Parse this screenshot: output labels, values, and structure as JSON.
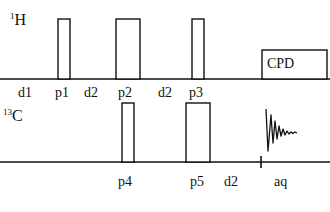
{
  "diagram": {
    "type": "nmr-pulse-sequence",
    "colors": {
      "line": "#111111",
      "background": "#ffffff"
    },
    "channels": [
      {
        "id": "H",
        "mass": "1",
        "nucleus": "H",
        "baseline_y": 79,
        "label_pos": {
          "x": 10,
          "y": 8
        },
        "elements": [
          {
            "kind": "pulse",
            "name": "p1",
            "x1": 58,
            "x2": 70,
            "top": 19
          },
          {
            "kind": "pulse",
            "name": "p2",
            "x1": 116,
            "x2": 140,
            "top": 19
          },
          {
            "kind": "pulse",
            "name": "p3",
            "x1": 192,
            "x2": 204,
            "top": 19
          },
          {
            "kind": "decoupling",
            "name": "CPD",
            "x1": 262,
            "x2": 327,
            "top": 50
          }
        ],
        "timing_labels": [
          {
            "text": "d1",
            "x": 18
          },
          {
            "text": "p1",
            "x": 55
          },
          {
            "text": "d2",
            "x": 84
          },
          {
            "text": "p2",
            "x": 118
          },
          {
            "text": "d2",
            "x": 158
          },
          {
            "text": "p3",
            "x": 189
          }
        ],
        "label_y": 86
      },
      {
        "id": "C",
        "mass": "13",
        "nucleus": "C",
        "baseline_y": 162,
        "label_pos": {
          "x": 3,
          "y": 104
        },
        "elements": [
          {
            "kind": "pulse",
            "name": "p4",
            "x1": 122,
            "x2": 134,
            "top": 103
          },
          {
            "kind": "pulse",
            "name": "p5",
            "x1": 186,
            "x2": 210,
            "top": 103
          },
          {
            "kind": "tick",
            "x": 261
          },
          {
            "kind": "fid",
            "name": "aq",
            "x": 266
          }
        ],
        "timing_labels": [
          {
            "text": "p4",
            "x": 118
          },
          {
            "text": "p5",
            "x": 190
          },
          {
            "text": "d2",
            "x": 224
          },
          {
            "text": "aq",
            "x": 274
          }
        ],
        "label_y": 175
      }
    ]
  }
}
